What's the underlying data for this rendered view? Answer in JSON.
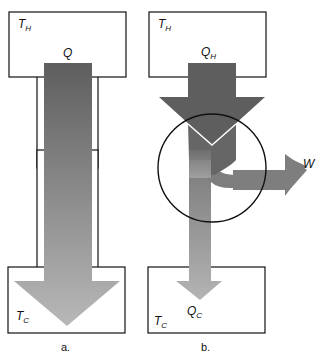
{
  "panel_a": {
    "hot_reservoir_label": "T",
    "hot_reservoir_sub": "H",
    "heat_label": "Q",
    "cold_reservoir_label": "T",
    "cold_reservoir_sub": "C",
    "caption": "a."
  },
  "panel_b": {
    "hot_reservoir_label": "T",
    "hot_reservoir_sub": "H",
    "heat_in_label": "Q",
    "heat_in_sub": "H",
    "work_label": "W",
    "heat_out_label": "Q",
    "heat_out_sub": "C",
    "cold_reservoir_label": "T",
    "cold_reservoir_sub": "C",
    "caption": "b."
  },
  "colors": {
    "arrow_dark": "#5e5e5e",
    "arrow_mid": "#7a7a7a",
    "arrow_light": "#b4b4b4",
    "outline": "#111111"
  }
}
